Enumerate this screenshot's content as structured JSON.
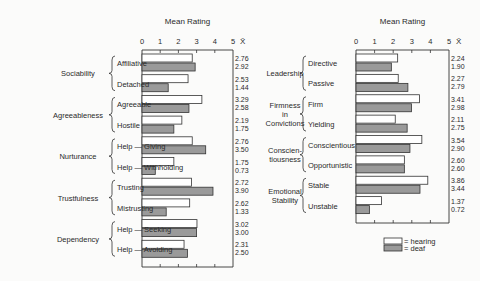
{
  "legend": {
    "hearing": "= hearing",
    "deaf": "= deaf"
  },
  "colors": {
    "hearing_fill": "#ffffff",
    "deaf_fill": "#9a9a9a",
    "stroke": "#333333"
  },
  "chart_data": [
    {
      "type": "bar",
      "orientation": "horizontal",
      "title": "Mean Rating",
      "xlabel": "Mean Rating",
      "mean_header": "X̄",
      "xlim": [
        0,
        5
      ],
      "ticks": [
        "0",
        "1",
        "2",
        "3",
        "4",
        "5"
      ],
      "series_names": [
        "hearing",
        "deaf"
      ],
      "groups": [
        {
          "label": "Sociability",
          "items": [
            {
              "label": "Affiliative",
              "hearing": 2.76,
              "deaf": 2.92,
              "hearing_text": "2.76",
              "deaf_text": "2.92"
            },
            {
              "label": "Detached",
              "hearing": 2.53,
              "deaf": 1.44,
              "hearing_text": "2.53",
              "deaf_text": "1.44"
            }
          ]
        },
        {
          "label": "Agreeableness",
          "items": [
            {
              "label": "Agreeable",
              "hearing": 3.29,
              "deaf": 2.58,
              "hearing_text": "3.29",
              "deaf_text": "2.58"
            },
            {
              "label": "Hostile",
              "hearing": 2.19,
              "deaf": 1.75,
              "hearing_text": "2.19",
              "deaf_text": "1.75"
            }
          ]
        },
        {
          "label": "Nurturance",
          "items": [
            {
              "label": "Help — Giving",
              "hearing": 2.76,
              "deaf": 3.5,
              "hearing_text": "2.76",
              "deaf_text": "3.50"
            },
            {
              "label": "Help — Withholding",
              "hearing": 1.75,
              "deaf": 0.73,
              "hearing_text": "1.75",
              "deaf_text": "0.73"
            }
          ]
        },
        {
          "label": "Trustfulness",
          "items": [
            {
              "label": "Trusting",
              "hearing": 2.72,
              "deaf": 3.9,
              "hearing_text": "2.72",
              "deaf_text": "3.90"
            },
            {
              "label": "Mistrusting",
              "hearing": 2.62,
              "deaf": 1.33,
              "hearing_text": "2.62",
              "deaf_text": "1.33"
            }
          ]
        },
        {
          "label": "Dependency",
          "items": [
            {
              "label": "Help — Seeking",
              "hearing": 3.02,
              "deaf": 3.0,
              "hearing_text": "3.02",
              "deaf_text": "3.00"
            },
            {
              "label": "Help — Avoiding",
              "hearing": 2.31,
              "deaf": 2.5,
              "hearing_text": "2.31",
              "deaf_text": "2.50"
            }
          ]
        }
      ]
    },
    {
      "type": "bar",
      "orientation": "horizontal",
      "title": "Mean Rating",
      "xlabel": "Mean Rating",
      "mean_header": "X̄",
      "xlim": [
        0,
        5
      ],
      "ticks": [
        "0",
        "1",
        "2",
        "3",
        "4",
        "5"
      ],
      "series_names": [
        "hearing",
        "deaf"
      ],
      "legend_position": "bottom-right",
      "groups": [
        {
          "label": [
            "Leadership"
          ],
          "items": [
            {
              "label": "Directive",
              "hearing": 2.24,
              "deaf": 1.9,
              "hearing_text": "2.24",
              "deaf_text": "1.90"
            },
            {
              "label": "Passive",
              "hearing": 2.27,
              "deaf": 2.79,
              "hearing_text": "2.27",
              "deaf_text": "2.79"
            }
          ]
        },
        {
          "label": [
            "Firmness",
            "in",
            "Convictions"
          ],
          "items": [
            {
              "label": "Firm",
              "hearing": 3.41,
              "deaf": 2.98,
              "hearing_text": "3.41",
              "deaf_text": "2.98"
            },
            {
              "label": "Yielding",
              "hearing": 2.11,
              "deaf": 2.75,
              "hearing_text": "2.11",
              "deaf_text": "2.75"
            }
          ]
        },
        {
          "label": [
            "Conscien-",
            "tiousness"
          ],
          "items": [
            {
              "label": "Conscientious",
              "hearing": 3.54,
              "deaf": 2.9,
              "hearing_text": "3.54",
              "deaf_text": "2.90"
            },
            {
              "label": "Opportunistic",
              "hearing": 2.6,
              "deaf": 2.6,
              "hearing_text": "2.60",
              "deaf_text": "2.60"
            }
          ]
        },
        {
          "label": [
            "Emotional",
            "Stability"
          ],
          "items": [
            {
              "label": "Stable",
              "hearing": 3.86,
              "deaf": 3.44,
              "hearing_text": "3.86",
              "deaf_text": "3.44"
            },
            {
              "label": "Unstable",
              "hearing": 1.37,
              "deaf": 0.72,
              "hearing_text": "1.37",
              "deaf_text": "0.72"
            }
          ]
        }
      ]
    }
  ]
}
